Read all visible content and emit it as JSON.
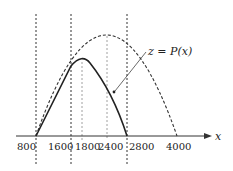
{
  "diagram": {
    "type": "function-graph",
    "curve_label": "z = P(x)",
    "axis_label": "x",
    "tick_labels": [
      "800",
      "1600",
      "1800",
      "2400",
      "2800",
      "4000"
    ],
    "vertical_guides": [
      "800",
      "1600",
      "2800"
    ],
    "curves": [
      {
        "name": "solid-parabola",
        "style": "solid",
        "roots": [
          800,
          2800
        ],
        "vertex_x": 1800,
        "meets_dashed_at": 1600
      },
      {
        "name": "dashed-parabola",
        "style": "dashed",
        "roots": [
          800,
          4000
        ],
        "vertex_x": 2400
      }
    ],
    "colors": {
      "ink": "#222222",
      "background": "#ffffff"
    }
  }
}
